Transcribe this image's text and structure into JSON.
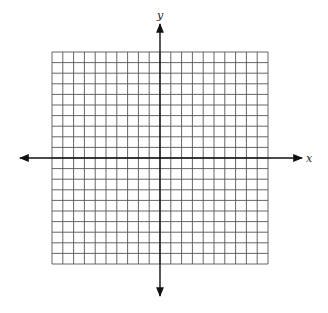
{
  "diagram": {
    "type": "coordinate-grid",
    "grid": {
      "columns": 20,
      "rows": 20,
      "left": 52,
      "top": 52,
      "right": 268,
      "bottom": 264,
      "line_color": "#555555",
      "line_width": 0.9
    },
    "axes": {
      "color": "#111111",
      "width": 1.4,
      "x_axis": {
        "y": 158,
        "x_start": 20,
        "x_end": 302,
        "label": "x",
        "label_x": 306,
        "label_y": 162
      },
      "y_axis": {
        "x": 160,
        "y_start": 24,
        "y_end": 296,
        "label": "y",
        "label_x": 157,
        "label_y": 19
      }
    },
    "background": "#ffffff"
  },
  "chart_data": {
    "type": "grid",
    "title": "",
    "xlabel": "x",
    "ylabel": "y",
    "xlim": [
      -10,
      10
    ],
    "ylim": [
      -10,
      10
    ],
    "grid": true,
    "x_ticks_units": 20,
    "y_ticks_units": 20,
    "arrows": [
      "left",
      "right",
      "up",
      "down"
    ]
  }
}
